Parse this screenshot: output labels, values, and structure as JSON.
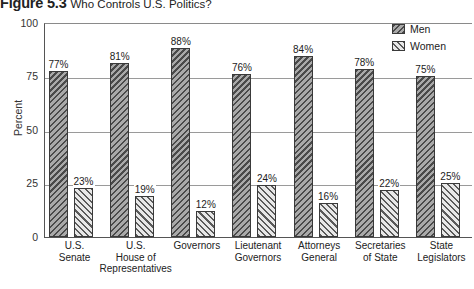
{
  "figure": {
    "number": "Figure 5.3",
    "caption": "Who Controls U.S. Politics?"
  },
  "legend": {
    "position": "top-right",
    "entries": [
      {
        "label": "Men",
        "pattern": "backslash-hatch",
        "color": "#8e8e8e"
      },
      {
        "label": "Women",
        "pattern": "forwardslash-hatch",
        "color": "#cfcfcf"
      }
    ]
  },
  "axis": {
    "y_title": "Percent",
    "y_ticks": [
      "0",
      "25",
      "50",
      "75",
      "100"
    ]
  },
  "chart_data": {
    "type": "bar",
    "title": "Who Controls U.S. Politics?",
    "xlabel": "",
    "ylabel": "Percent",
    "ylim": [
      0,
      100
    ],
    "yticks": [
      0,
      25,
      50,
      75,
      100
    ],
    "grid": true,
    "legend_position": "top-right",
    "categories": [
      "U.S. Senate",
      "U.S. House of Representatives",
      "Governors",
      "Lieutenant Governors",
      "Attorneys General",
      "Secretaries of State",
      "State Legislators"
    ],
    "category_lines": [
      [
        "U.S.",
        "Senate"
      ],
      [
        "U.S.",
        "House of",
        "Representatives"
      ],
      [
        "Governors"
      ],
      [
        "Lieutenant",
        "Governors"
      ],
      [
        "Attorneys",
        "General"
      ],
      [
        "Secretaries",
        "of State"
      ],
      [
        "State",
        "Legislators"
      ]
    ],
    "series": [
      {
        "name": "Men",
        "values": [
          77,
          81,
          88,
          76,
          84,
          78,
          75
        ],
        "labels": [
          "77%",
          "81%",
          "88%",
          "76%",
          "84%",
          "78%",
          "75%"
        ]
      },
      {
        "name": "Women",
        "values": [
          23,
          19,
          12,
          24,
          16,
          22,
          25
        ],
        "labels": [
          "23%",
          "19%",
          "12%",
          "24%",
          "16%",
          "22%",
          "25%"
        ]
      }
    ]
  }
}
